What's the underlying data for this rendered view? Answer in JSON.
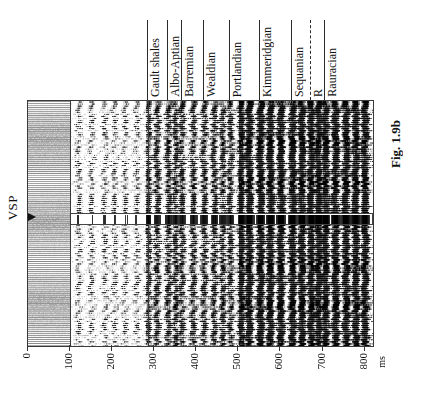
{
  "figure": {
    "caption": "Fig. 1.9b",
    "vsp_label": "VSP",
    "vsp_marker_icon": "right-arrow-icon"
  },
  "time_axis": {
    "unit": "ms",
    "ticks": [
      "0",
      "100",
      "200",
      "300",
      "400",
      "500",
      "600",
      "700",
      "800"
    ],
    "tick_values": [
      0,
      100,
      200,
      300,
      400,
      500,
      600,
      700,
      800
    ],
    "range": [
      0,
      820
    ]
  },
  "markers": [
    {
      "label": "Gault shales",
      "time_ms": 285,
      "style": "solid"
    },
    {
      "label": "Albo-Aptian",
      "time_ms": 333,
      "style": "solid"
    },
    {
      "label": "Barremian",
      "time_ms": 365,
      "style": "solid"
    },
    {
      "label": "Wealdian",
      "time_ms": 418,
      "style": "solid"
    },
    {
      "label": "Portlandian",
      "time_ms": 480,
      "style": "solid"
    },
    {
      "label": "Kimmeridgian",
      "time_ms": 552,
      "style": "solid"
    },
    {
      "label": "Sequanian",
      "time_ms": 628,
      "style": "solid"
    },
    {
      "label": "R",
      "time_ms": 672,
      "style": "dashed"
    },
    {
      "label": "Rauracian",
      "time_ms": 706,
      "style": "solid"
    }
  ],
  "chart_data": {
    "type": "heatmap",
    "title": "Fig. 1.9b",
    "xlabel": "ms",
    "ylabel": "",
    "xlim": [
      0,
      820
    ],
    "grid": false,
    "legend": "none",
    "zones": [
      {
        "name": "muted-gray-zone",
        "from_ms": 0,
        "to_ms": 100,
        "amplitude": 0.12
      },
      {
        "name": "low-amplitude",
        "from_ms": 100,
        "to_ms": 280,
        "amplitude": 0.38
      },
      {
        "name": "mid-amplitude",
        "from_ms": 280,
        "to_ms": 500,
        "amplitude": 0.62
      },
      {
        "name": "high-amplitude",
        "from_ms": 500,
        "to_ms": 820,
        "amplitude": 0.92
      }
    ],
    "vsp_insert": {
      "from_trace": 0.46,
      "to_trace": 0.5,
      "start_ms": 100
    },
    "events_ms": [
      120,
      150,
      182,
      205,
      230,
      258,
      285,
      306,
      333,
      350,
      365,
      392,
      418,
      442,
      462,
      480,
      505,
      525,
      552,
      575,
      600,
      628,
      650,
      672,
      690,
      706,
      730,
      755,
      778,
      800
    ]
  }
}
